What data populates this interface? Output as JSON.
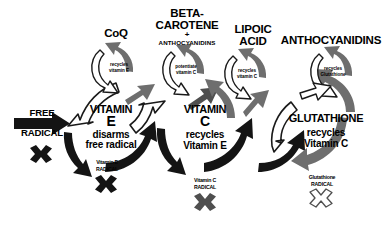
{
  "diagram": {
    "colors": {
      "black": "#141414",
      "dark_gray": "#4f4f4f",
      "mid_gray": "#6e6e6e",
      "light_gray": "#9a9a9a",
      "outline": "#1a1a1a",
      "white": "#ffffff",
      "background": "#ffffff"
    },
    "headers": [
      {
        "id": "coq",
        "label": "CoQ",
        "sub": "",
        "plus": ""
      },
      {
        "id": "beta-carotene",
        "label": "BETA-\nCAROTENE",
        "line1": "BETA-",
        "line2": "CAROTENE",
        "plus": "+",
        "sub": "ANTHOCYANIDINS"
      },
      {
        "id": "lipoic-acid",
        "line1": "LIPOIC",
        "line2": "ACID",
        "sub": "",
        "plus": ""
      },
      {
        "id": "anthocyanidins",
        "label": "ANTHOCYANIDINS",
        "sub": "",
        "plus": ""
      }
    ],
    "small_cycles": [
      {
        "id": "coq-cycle",
        "line1": "recycles",
        "line2": "vitamin E"
      },
      {
        "id": "beta-carotene-cycle",
        "line1": "potentiate",
        "line2": "vitamin C"
      },
      {
        "id": "lipoic-acid-cycle",
        "line1": "recycles",
        "line2": "vitamin C"
      },
      {
        "id": "anthocyanidins-cycle",
        "line1": "recycles",
        "line2": "Glutathione"
      }
    ],
    "main_nodes": [
      {
        "id": "vitamin-e",
        "name_line1": "VITAMIN",
        "name_line2": "E",
        "desc_line1": "disarms",
        "desc_line2": "free radical",
        "radical_line1": "Vitamin E",
        "radical_line2": "RADICAL",
        "radical_x_style": "black"
      },
      {
        "id": "vitamin-c",
        "name_line1": "VITAMIN",
        "name_line2": "C",
        "desc_line1": "recycles",
        "desc_line2": "Vitamin E",
        "radical_line1": "Vitamin C",
        "radical_line2": "RADICAL",
        "radical_x_style": "gray"
      },
      {
        "id": "glutathione",
        "name_line1": "GLUTATHIONE",
        "name_line2": "",
        "desc_line1": "recycles",
        "desc_line2": "Vitamin C",
        "radical_line1": "Glutathione",
        "radical_line2": "RADICAL",
        "radical_x_style": "white"
      }
    ],
    "input": {
      "id": "free-radical",
      "line1": "FREE",
      "line2": "RADICAL",
      "x_mark_style": "black"
    }
  }
}
